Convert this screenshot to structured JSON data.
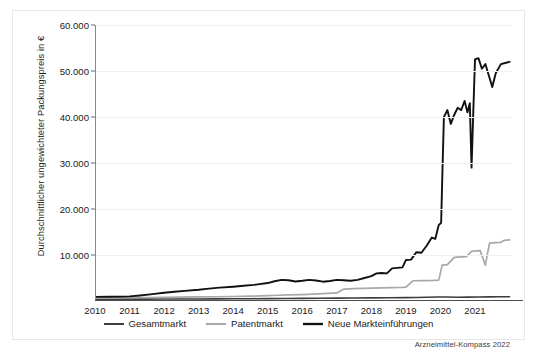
{
  "chart_data": {
    "type": "line",
    "title": "",
    "xlabel": "",
    "ylabel": "Durchschnittlicher ungewichteter Packungspreis in €",
    "source": "Arzneimittel-Kompass 2022",
    "grid": true,
    "legend_position": "bottom",
    "xlim": [
      2010,
      2022.1
    ],
    "ylim": [
      0,
      60000
    ],
    "ytick_labels": [
      "60.000",
      "50.000",
      "40.000",
      "30.000",
      "20.000",
      "10.000"
    ],
    "ytick_values": [
      60000,
      50000,
      40000,
      30000,
      20000,
      10000
    ],
    "xtick_labels": [
      "2010",
      "2011",
      "2012",
      "2013",
      "2014",
      "2015",
      "2016",
      "2017",
      "2018",
      "2019",
      "2020",
      "2021"
    ],
    "xtick_values": [
      2010,
      2011,
      2012,
      2013,
      2014,
      2015,
      2016,
      2017,
      2018,
      2019,
      2020,
      2021
    ],
    "colors": {
      "gesamtmarkt": "#3d3d3d",
      "patentmarkt": "#a8a8a8",
      "neue_markteinfuehrungen": "#111111",
      "grid": "#f1f1f1",
      "axis": "#4d4d4d",
      "background": "#ffffff"
    },
    "series": [
      {
        "name": "Gesamtmarkt",
        "color": "#3d3d3d",
        "width": 1.6,
        "points": [
          [
            2010.0,
            380
          ],
          [
            2010.5,
            390
          ],
          [
            2011.0,
            400
          ],
          [
            2011.5,
            410
          ],
          [
            2012.0,
            420
          ],
          [
            2012.5,
            435
          ],
          [
            2013.0,
            450
          ],
          [
            2013.5,
            465
          ],
          [
            2014.0,
            480
          ],
          [
            2014.5,
            500
          ],
          [
            2015.0,
            520
          ],
          [
            2015.5,
            545
          ],
          [
            2016.0,
            565
          ],
          [
            2016.5,
            590
          ],
          [
            2017.0,
            615
          ],
          [
            2017.5,
            640
          ],
          [
            2018.0,
            670
          ],
          [
            2018.5,
            700
          ],
          [
            2019.0,
            735
          ],
          [
            2019.3,
            760
          ],
          [
            2019.6,
            820
          ],
          [
            2019.9,
            860
          ],
          [
            2020.2,
            855
          ],
          [
            2020.5,
            830
          ],
          [
            2020.8,
            845
          ],
          [
            2021.1,
            880
          ],
          [
            2021.4,
            905
          ],
          [
            2021.7,
            925
          ],
          [
            2022.0,
            940
          ]
        ]
      },
      {
        "name": "Patentmarkt",
        "color": "#a8a8a8",
        "width": 1.7,
        "points": [
          [
            2010.0,
            700
          ],
          [
            2010.5,
            720
          ],
          [
            2011.0,
            740
          ],
          [
            2011.5,
            760
          ],
          [
            2012.0,
            800
          ],
          [
            2012.5,
            840
          ],
          [
            2013.0,
            880
          ],
          [
            2013.5,
            920
          ],
          [
            2014.0,
            980
          ],
          [
            2014.5,
            1050
          ],
          [
            2015.0,
            1150
          ],
          [
            2015.3,
            1250
          ],
          [
            2015.6,
            1320
          ],
          [
            2016.0,
            1400
          ],
          [
            2016.3,
            1500
          ],
          [
            2016.6,
            1600
          ],
          [
            2017.0,
            1750
          ],
          [
            2017.2,
            2600
          ],
          [
            2017.5,
            2700
          ],
          [
            2017.8,
            2750
          ],
          [
            2018.0,
            2800
          ],
          [
            2018.3,
            2850
          ],
          [
            2018.6,
            2900
          ],
          [
            2018.9,
            2950
          ],
          [
            2019.0,
            3000
          ],
          [
            2019.2,
            4400
          ],
          [
            2019.5,
            4450
          ],
          [
            2019.8,
            4500
          ],
          [
            2019.95,
            4550
          ],
          [
            2020.05,
            7800
          ],
          [
            2020.2,
            7900
          ],
          [
            2020.4,
            9500
          ],
          [
            2020.6,
            9600
          ],
          [
            2020.75,
            9650
          ],
          [
            2020.9,
            10800
          ],
          [
            2021.0,
            10900
          ],
          [
            2021.15,
            10950
          ],
          [
            2021.3,
            7800
          ],
          [
            2021.42,
            12600
          ],
          [
            2021.6,
            12700
          ],
          [
            2021.75,
            12750
          ],
          [
            2021.85,
            13200
          ],
          [
            2022.0,
            13300
          ]
        ]
      },
      {
        "name": "Neue Markteinführungen",
        "color": "#111111",
        "width": 1.9,
        "points": [
          [
            2010.0,
            900
          ],
          [
            2010.4,
            920
          ],
          [
            2010.8,
            960
          ],
          [
            2011.0,
            1000
          ],
          [
            2011.3,
            1200
          ],
          [
            2011.6,
            1450
          ],
          [
            2012.0,
            1800
          ],
          [
            2012.3,
            2000
          ],
          [
            2012.6,
            2200
          ],
          [
            2013.0,
            2450
          ],
          [
            2013.3,
            2700
          ],
          [
            2013.6,
            2900
          ],
          [
            2014.0,
            3100
          ],
          [
            2014.3,
            3300
          ],
          [
            2014.6,
            3500
          ],
          [
            2015.0,
            3900
          ],
          [
            2015.2,
            4300
          ],
          [
            2015.4,
            4600
          ],
          [
            2015.6,
            4500
          ],
          [
            2015.8,
            4250
          ],
          [
            2016.0,
            4400
          ],
          [
            2016.2,
            4600
          ],
          [
            2016.4,
            4450
          ],
          [
            2016.6,
            4200
          ],
          [
            2016.8,
            4350
          ],
          [
            2017.0,
            4600
          ],
          [
            2017.2,
            4500
          ],
          [
            2017.4,
            4400
          ],
          [
            2017.6,
            4600
          ],
          [
            2017.8,
            5000
          ],
          [
            2018.0,
            5400
          ],
          [
            2018.15,
            6000
          ],
          [
            2018.3,
            6100
          ],
          [
            2018.45,
            6000
          ],
          [
            2018.6,
            7100
          ],
          [
            2018.75,
            7200
          ],
          [
            2018.9,
            7300
          ],
          [
            2019.0,
            8900
          ],
          [
            2019.15,
            9000
          ],
          [
            2019.3,
            10600
          ],
          [
            2019.45,
            10500
          ],
          [
            2019.6,
            12000
          ],
          [
            2019.75,
            13800
          ],
          [
            2019.85,
            13500
          ],
          [
            2019.95,
            16500
          ],
          [
            2020.02,
            17000
          ],
          [
            2020.06,
            28900
          ],
          [
            2020.1,
            40000
          ],
          [
            2020.2,
            41500
          ],
          [
            2020.3,
            38500
          ],
          [
            2020.4,
            40500
          ],
          [
            2020.5,
            42000
          ],
          [
            2020.6,
            41500
          ],
          [
            2020.7,
            43500
          ],
          [
            2020.78,
            41000
          ],
          [
            2020.85,
            43000
          ],
          [
            2020.9,
            29000
          ],
          [
            2020.95,
            41000
          ],
          [
            2021.0,
            52500
          ],
          [
            2021.1,
            52800
          ],
          [
            2021.2,
            50500
          ],
          [
            2021.3,
            51500
          ],
          [
            2021.4,
            49000
          ],
          [
            2021.5,
            46500
          ],
          [
            2021.6,
            49500
          ],
          [
            2021.75,
            51500
          ],
          [
            2021.9,
            51800
          ],
          [
            2022.0,
            52000
          ]
        ]
      }
    ]
  }
}
